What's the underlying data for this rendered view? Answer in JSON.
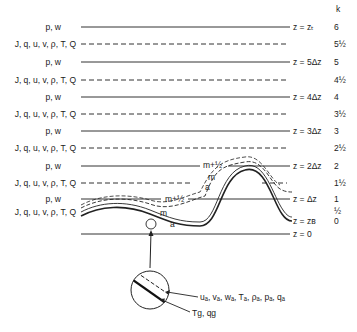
{
  "figure": {
    "k_header": "k",
    "levels": [
      {
        "y": 27,
        "type": "solid",
        "left_label": "p, w",
        "right_label": "z = zₜ",
        "k": "6"
      },
      {
        "y": 44,
        "type": "dashed",
        "left_label": "J, q, u, v, ρ, T, Q",
        "right_label": "",
        "k": "5½"
      },
      {
        "y": 62,
        "type": "solid",
        "left_label": "p, w",
        "right_label": "z = 5Δz",
        "k": "5"
      },
      {
        "y": 80,
        "type": "dashed",
        "left_label": "J, q, u, v, ρ, T, Q",
        "right_label": "",
        "k": "4½"
      },
      {
        "y": 97,
        "type": "solid",
        "left_label": "p, w",
        "right_label": "z = 4Δz",
        "k": "4"
      },
      {
        "y": 114,
        "type": "dashed",
        "left_label": "J, q, u, v, ρ, T, Q",
        "right_label": "",
        "k": "3½"
      },
      {
        "y": 131,
        "type": "solid",
        "left_label": "p, w",
        "right_label": "z = 3Δz",
        "k": "3"
      },
      {
        "y": 148,
        "type": "dashed",
        "left_label": "J, q, u, v, ρ, T, Q",
        "right_label": "",
        "k": "2½"
      },
      {
        "y": 166,
        "type": "solid",
        "left_label": "p, w",
        "right_label": "z = 2Δz",
        "k": "2"
      },
      {
        "y": 183,
        "type": "dashed",
        "left_label": "J, q, u, v, ρ, T, Q",
        "right_label": "",
        "k": "1½"
      },
      {
        "y": 199,
        "type": "solid",
        "left_label": "p, w",
        "right_label": "z =   Δz",
        "k": "1"
      },
      {
        "y": 212,
        "type": "none",
        "left_label": "J, q, u, v, ρ, T, Q",
        "right_label": "",
        "k": "½"
      },
      {
        "y": 222,
        "type": "none",
        "left_label": "",
        "right_label": "z = zʙ",
        "k": "0"
      },
      {
        "y": 234,
        "type": "solid",
        "left_label": "",
        "right_label": "z = 0",
        "k": ""
      }
    ],
    "curve_labels": {
      "m_plus_half_upper": "m+½",
      "m_upper": "m",
      "a_upper": "a",
      "m_plus_half_lower": "m+½",
      "m_lower": "m",
      "a_lower": "a"
    },
    "inset": {
      "surface_vars": "uₐ, vₐ, wₐ, Tₐ, ρₐ, pₐ, qₐ",
      "ground_vars": "Tɡ, qɡ"
    }
  }
}
